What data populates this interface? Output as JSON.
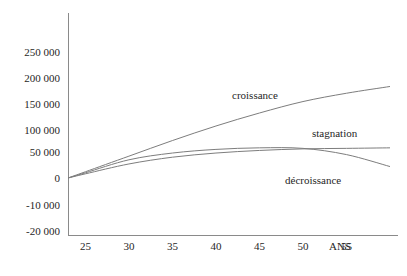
{
  "chart_data": {
    "type": "line",
    "title": "",
    "xlabel": "ANS",
    "ylabel": "",
    "grid": false,
    "legend_position": "inline-annotations",
    "x": [
      23,
      25,
      30,
      35,
      40,
      45,
      50,
      55,
      60
    ],
    "xlim": [
      23,
      60
    ],
    "ylim": [
      -20000,
      270000
    ],
    "x_ticks": [
      {
        "value": 25,
        "label": "25"
      },
      {
        "value": 30,
        "label": "30"
      },
      {
        "value": 35,
        "label": "35"
      },
      {
        "value": 40,
        "label": "40"
      },
      {
        "value": 45,
        "label": "45"
      },
      {
        "value": 50,
        "label": "50"
      },
      {
        "value": 55,
        "label": "55"
      }
    ],
    "y_ticks": [
      {
        "label": "250 000",
        "py": 52
      },
      {
        "label": "200 000",
        "py": 78
      },
      {
        "label": "150 000",
        "py": 104
      },
      {
        "label": "100 000",
        "py": 130
      },
      {
        "label": "50 000",
        "py": 152
      },
      {
        "label": "0",
        "py": 178
      },
      {
        "label": "-10 000",
        "py": 205
      },
      {
        "label": "-20 000",
        "py": 231
      }
    ],
    "series": [
      {
        "name": "croissance",
        "label": "croissance",
        "values": [
          0,
          12000,
          42000,
          72000,
          100000,
          125000,
          147000,
          163000,
          176000
        ],
        "label_x": 232,
        "label_y": 99
      },
      {
        "name": "stagnation",
        "label": "stagnation",
        "values": [
          0,
          8000,
          27000,
          40000,
          48000,
          53000,
          56000,
          57000,
          58000
        ],
        "label_x": 312,
        "label_y": 137
      },
      {
        "name": "decroissance",
        "label": "décroissance",
        "values": [
          0,
          10000,
          35000,
          48000,
          55000,
          58000,
          57000,
          45000,
          22000
        ],
        "label_x": 285,
        "label_y": 184
      }
    ]
  }
}
